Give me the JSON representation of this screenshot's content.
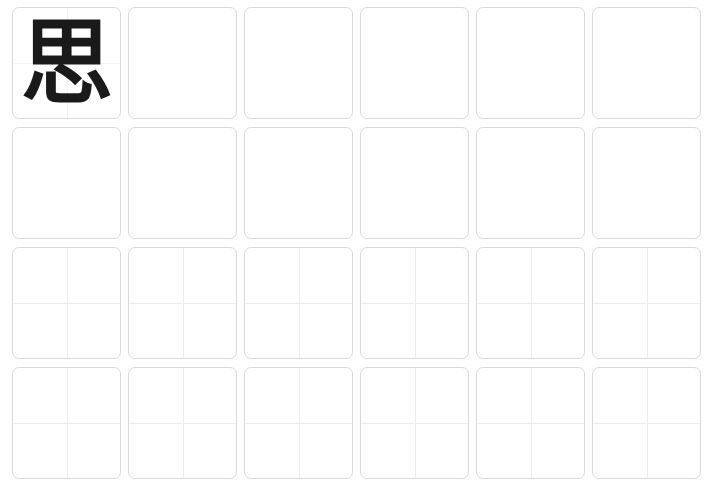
{
  "worksheet": {
    "rows": 4,
    "columns": 6,
    "model_character": "思",
    "row_styles": [
      "model-then-blank",
      "blank",
      "cross-guides",
      "cross-guides"
    ]
  }
}
